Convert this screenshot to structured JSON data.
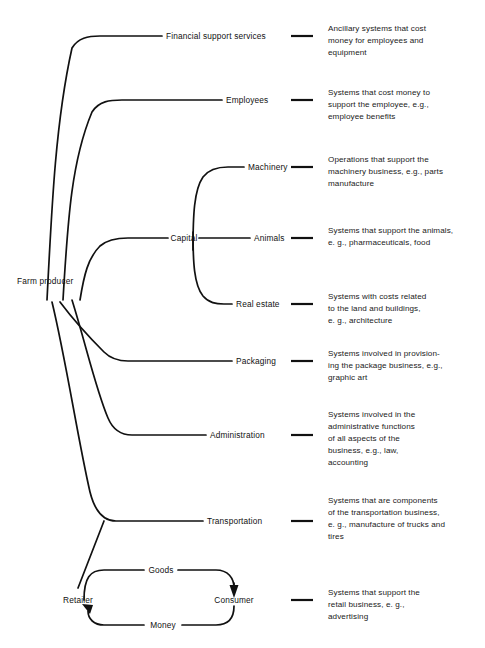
{
  "diagram": {
    "type": "tree-with-feedback-loop",
    "root": {
      "label": "Farm producer"
    },
    "branches": [
      {
        "label": "Financial support services",
        "description": [
          "Ancillary systems that cost",
          "money for employees and",
          "equipment"
        ]
      },
      {
        "label": "Employees",
        "description": [
          "Systems that cost money to",
          "support the employee, e.g.,",
          "employee benefits"
        ]
      },
      {
        "label": "Capital",
        "description": []
      },
      {
        "label": "Machinery",
        "description": [
          "Operations that support the",
          "machinery business, e.g., parts",
          "manufacture"
        ]
      },
      {
        "label": "Animals",
        "description": [
          "Systems that support the animals,",
          "e. g., pharmaceuticals, food"
        ]
      },
      {
        "label": "Real estate",
        "description": [
          "Systems with costs related",
          "to the land and buildings,",
          "e. g., architecture"
        ]
      },
      {
        "label": "Packaging",
        "description": [
          "Systems involved in provision-",
          "ing the package business, e.g.,",
          "graphic art"
        ]
      },
      {
        "label": "Administration",
        "description": [
          "Systems involved in the",
          "administrative functions",
          "of all aspects of the",
          "business, e.g., law,",
          "accounting"
        ]
      },
      {
        "label": "Transportation",
        "description": [
          "Systems that are components",
          "of the transportation business,",
          "e. g., manufacture of trucks and",
          "tires"
        ]
      },
      {
        "label": "Retailer",
        "description": []
      },
      {
        "label": "Consumer",
        "description": [
          "Systems that support the",
          "retail business, e. g.,",
          "advertising"
        ]
      }
    ],
    "flows": [
      {
        "label": "Goods",
        "from": "Retailer",
        "to": "Consumer"
      },
      {
        "label": "Money",
        "from": "Consumer",
        "to": "Retailer"
      }
    ],
    "colors": {
      "line": "#111111",
      "text": "#111111",
      "background": "#ffffff"
    }
  }
}
